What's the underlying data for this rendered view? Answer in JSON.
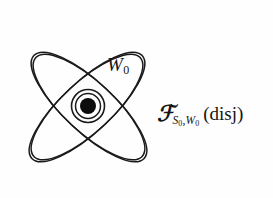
{
  "figure": {
    "caption_present": false,
    "background_color": "#fefefe",
    "stroke_color": "#1a1a1a",
    "fill_color": "#000000",
    "canvas": {
      "width": 273,
      "height": 198
    }
  },
  "labels": {
    "w0": {
      "letter": "W",
      "subscript": "0",
      "full_text": "W0"
    },
    "family": {
      "script_symbol": "ℱ",
      "sub_s": "S",
      "sub_s_index": "0",
      "comma": ",",
      "sub_w": "W",
      "sub_w_index": "0",
      "qualifier": "(disj)",
      "full_text": "F_{S0,W0} (disj)"
    }
  },
  "diagram": {
    "center": {
      "x": 88,
      "y": 106
    },
    "petals": [
      {
        "name": "petal-upper-right",
        "cx": 88,
        "cy": 106,
        "rx": 74,
        "ry": 25,
        "rotation_deg": -43,
        "tip": {
          "x": 172,
          "y": 25
        }
      },
      {
        "name": "petal-upper-left",
        "cx": 88,
        "cy": 106,
        "rx": 74,
        "ry": 25,
        "rotation_deg": 43,
        "tip": {
          "x": 20,
          "y": 33
        }
      },
      {
        "name": "petal-lower-left",
        "cx": 88,
        "cy": 106,
        "rx": 74,
        "ry": 25,
        "rotation_deg": -43,
        "tip": {
          "x": 18,
          "y": 174
        }
      },
      {
        "name": "petal-lower-right",
        "cx": 88,
        "cy": 106,
        "rx": 74,
        "ry": 25,
        "rotation_deg": 43,
        "tip": {
          "x": 175,
          "y": 184
        }
      }
    ],
    "center_marks": [
      {
        "name": "outer-ring",
        "r": 17
      },
      {
        "name": "inner-ring",
        "r": 13
      },
      {
        "name": "core-dot",
        "r": 8,
        "filled": true
      }
    ]
  }
}
